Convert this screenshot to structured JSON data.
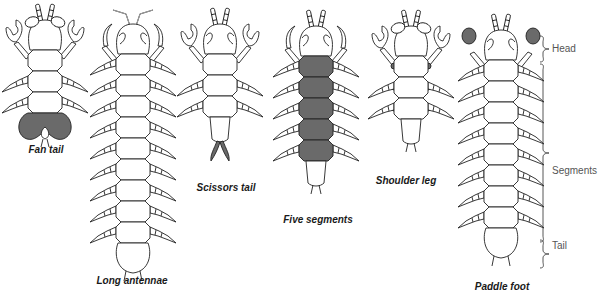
{
  "figure": {
    "variants": [
      {
        "id": "fan-tail",
        "label": "Fan tail",
        "center_x": 45,
        "head_y": 34,
        "segments": 3,
        "highlight": "tail-fan",
        "claws": "pincer"
      },
      {
        "id": "long-antennae",
        "label": "Long antennae",
        "center_x": 133,
        "head_y": 38,
        "segments": 9,
        "highlight": "antennae",
        "claws": "hook"
      },
      {
        "id": "scissors-tail",
        "label": "Scissors tail",
        "center_x": 220,
        "head_y": 38,
        "segments": 3,
        "highlight": "tail-scissors",
        "claws": "pincer"
      },
      {
        "id": "five-segments",
        "label": "Five segments",
        "center_x": 316,
        "head_y": 40,
        "segments": 5,
        "highlight": "segments",
        "claws": "hook"
      },
      {
        "id": "shoulder-leg",
        "label": "Shoulder leg",
        "center_x": 411,
        "head_y": 40,
        "segments": 3,
        "highlight": "shoulder",
        "claws": "pincer"
      },
      {
        "id": "paddle-foot",
        "label": "Paddle foot",
        "center_x": 501,
        "head_y": 44,
        "segments": 8,
        "highlight": "paddle",
        "claws": "paddle"
      }
    ],
    "label_positions": {
      "fan-tail": {
        "x": 46,
        "y": 150
      },
      "long-antennae": {
        "x": 130,
        "y": 276
      },
      "scissors-tail": {
        "x": 226,
        "y": 182
      },
      "five-segments": {
        "x": 317,
        "y": 215
      },
      "shoulder-leg": {
        "x": 406,
        "y": 175
      },
      "paddle-foot": {
        "x": 501,
        "y": 282
      }
    },
    "anatomy_key": {
      "head": "Head",
      "segments": "Segments",
      "tail": "Tail"
    },
    "colors": {
      "outline": "#222222",
      "highlight": "#6a6a6a",
      "background": "#ffffff",
      "key_text": "#555555"
    }
  }
}
